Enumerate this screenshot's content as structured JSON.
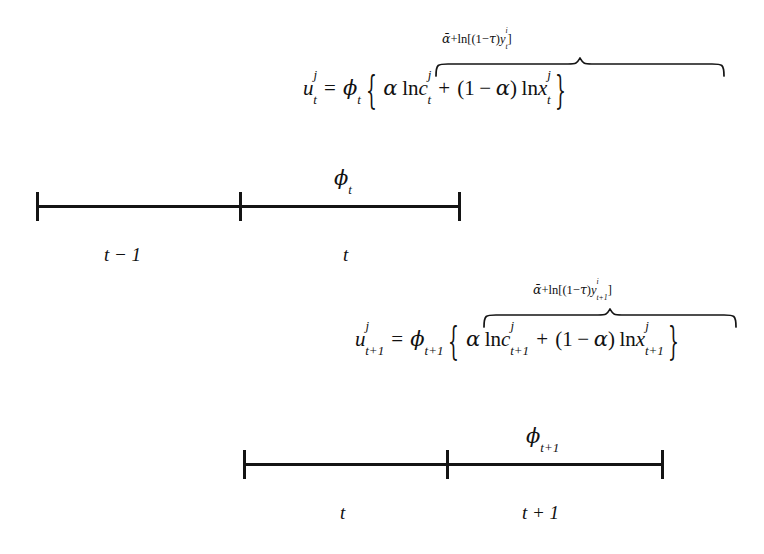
{
  "figure": {
    "type": "two-period-timeline-with-utility-equations",
    "background_color": "#ffffff",
    "ink_color": "#141414"
  },
  "equations": [
    {
      "id": "utility-t",
      "overbrace_label": {
        "alpha_bar": "ᾱ",
        "plus": "+",
        "ln": "ln",
        "bracket_open": "[(",
        "one": "1",
        "minus": "−",
        "tau": "τ",
        "paren_close": ")",
        "y": "y",
        "y_sub": "t",
        "y_sup": "i",
        "bracket_close": "]"
      },
      "lhs": {
        "u": "u",
        "u_sup": "j",
        "u_sub": "t"
      },
      "equals": "=",
      "phi": {
        "symbol": "ϕ",
        "sub": "t"
      },
      "brace_open": "{",
      "brace_close": "}",
      "body": {
        "alpha": "α",
        "ln1": "ln",
        "c": "c",
        "c_sup": "j",
        "c_sub": "t",
        "plus": "+",
        "paren_open": "(",
        "one": "1",
        "minus": "−",
        "alpha2": "α",
        "paren_close": ")",
        "ln2": "ln",
        "x": "x",
        "x_sup": "j",
        "x_sub": "t"
      }
    },
    {
      "id": "utility-t-plus-1",
      "overbrace_label": {
        "alpha_bar": "ᾱ",
        "plus": "+",
        "ln": "ln",
        "bracket_open": "[(",
        "one": "1",
        "minus": "−",
        "tau": "τ",
        "paren_close": ")",
        "y": "y",
        "y_sub": "t+1",
        "y_sup": "i",
        "bracket_close": "]"
      },
      "lhs": {
        "u": "u",
        "u_sup": "j",
        "u_sub": "t+1"
      },
      "equals": "=",
      "phi": {
        "symbol": "ϕ",
        "sub": "t+1"
      },
      "brace_open": "{",
      "brace_close": "}",
      "body": {
        "alpha": "α",
        "ln1": "ln",
        "c": "c",
        "c_sup": "j",
        "c_sub": "t+1",
        "plus": "+",
        "paren_open": "(",
        "one": "1",
        "minus": "−",
        "alpha2": "α",
        "paren_close": ")",
        "ln2": "ln",
        "x": "x",
        "x_sup": "j",
        "x_sub": "t+1"
      }
    }
  ],
  "timelines": [
    {
      "id": "timeline-t",
      "phi_label": "ϕ",
      "phi_sub": "t",
      "period_labels": [
        "t − 1",
        "t"
      ]
    },
    {
      "id": "timeline-t-plus-1",
      "phi_label": "ϕ",
      "phi_sub": "t+1",
      "period_labels": [
        "t",
        "t + 1"
      ]
    }
  ]
}
